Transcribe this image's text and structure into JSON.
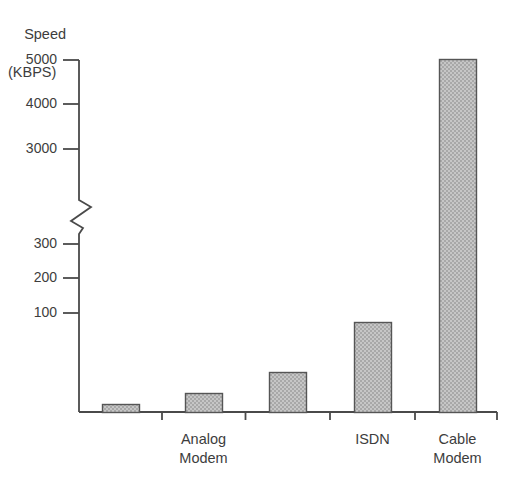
{
  "chart_data": {
    "type": "bar",
    "title": "",
    "ylabel": "Speed (KBPS)",
    "xlabel": "",
    "categories": [
      "",
      "Analog Modem",
      "",
      "ISDN",
      "Cable Modem"
    ],
    "values": [
      14.4,
      28.8,
      56,
      128,
      5000
    ],
    "ytick_labels_lower": [
      "100",
      "200",
      "300"
    ],
    "ytick_values_lower": [
      100,
      200,
      300
    ],
    "ytick_labels_upper": [
      "3000",
      "4000",
      "5000"
    ],
    "ytick_values_upper": [
      3000,
      4000,
      5000
    ],
    "axis_break": true,
    "axis_break_note": "broken y-axis between 300 and 3000",
    "grid": false,
    "legend": "none",
    "ylim_lower": [
      0,
      300
    ],
    "ylim_upper": [
      3000,
      5000
    ]
  },
  "axis": {
    "ylabel_line1": "Speed",
    "ylabel_line2": "(KBPS)",
    "ticks": [
      {
        "label": "5000",
        "y": 60
      },
      {
        "label": "4000",
        "y": 104
      },
      {
        "label": "3000",
        "y": 149
      },
      {
        "label": "300",
        "y": 244
      },
      {
        "label": "200",
        "y": 278
      },
      {
        "label": "100",
        "y": 313
      }
    ]
  },
  "bars": [
    {
      "name": "bar-1",
      "label_line1": "",
      "label_line2": "",
      "x": 102,
      "width": 37,
      "top": 404
    },
    {
      "name": "bar-2",
      "label_line1": "Analog",
      "label_line2": "Modem",
      "x": 185,
      "width": 37,
      "top": 393
    },
    {
      "name": "bar-3",
      "label_line1": "",
      "label_line2": "",
      "x": 269,
      "width": 37,
      "top": 372
    },
    {
      "name": "bar-4",
      "label_line1": "ISDN",
      "label_line2": "",
      "x": 354,
      "width": 37,
      "top": 322
    },
    {
      "name": "bar-5",
      "label_line1": "Cable",
      "label_line2": "Modem",
      "x": 439,
      "width": 37,
      "top": 59
    }
  ],
  "style": {
    "bar_fill": "#b9b9b9",
    "bar_stroke": "#555555",
    "axis_stroke": "#4a4a4a",
    "text_color": "#3d3d3d",
    "background": "#ffffff"
  }
}
